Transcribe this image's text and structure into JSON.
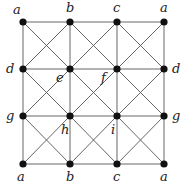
{
  "diagram": {
    "type": "graph",
    "grid_x": [
      23,
      70,
      117,
      164
    ],
    "grid_y": [
      22,
      69,
      116,
      164
    ],
    "colors": {
      "edge": "#555555",
      "node": "#111111",
      "label": "#222222"
    },
    "nodes": [
      {
        "id": "n00",
        "col": 0,
        "row": 0,
        "label": "a",
        "lx": 13,
        "ly": 14
      },
      {
        "id": "n10",
        "col": 1,
        "row": 0,
        "label": "b",
        "lx": 66,
        "ly": 12
      },
      {
        "id": "n20",
        "col": 2,
        "row": 0,
        "label": "c",
        "lx": 113,
        "ly": 12
      },
      {
        "id": "n30",
        "col": 3,
        "row": 0,
        "label": "a",
        "lx": 160,
        "ly": 12
      },
      {
        "id": "n01",
        "col": 0,
        "row": 1,
        "label": "d",
        "lx": 6,
        "ly": 73
      },
      {
        "id": "n11",
        "col": 1,
        "row": 1,
        "label": "e",
        "lx": 56,
        "ly": 82
      },
      {
        "id": "n21",
        "col": 2,
        "row": 1,
        "label": "f",
        "lx": 101,
        "ly": 82
      },
      {
        "id": "n31",
        "col": 3,
        "row": 1,
        "label": "d",
        "lx": 172,
        "ly": 73
      },
      {
        "id": "n02",
        "col": 0,
        "row": 2,
        "label": "g",
        "lx": 6,
        "ly": 120
      },
      {
        "id": "n12",
        "col": 1,
        "row": 2,
        "label": "h",
        "lx": 61,
        "ly": 134
      },
      {
        "id": "n22",
        "col": 2,
        "row": 2,
        "label": "i",
        "lx": 111,
        "ly": 134
      },
      {
        "id": "n32",
        "col": 3,
        "row": 2,
        "label": "g",
        "lx": 172,
        "ly": 120
      },
      {
        "id": "n03",
        "col": 0,
        "row": 3,
        "label": "a",
        "lx": 17,
        "ly": 181
      },
      {
        "id": "n13",
        "col": 1,
        "row": 3,
        "label": "b",
        "lx": 66,
        "ly": 181
      },
      {
        "id": "n23",
        "col": 2,
        "row": 3,
        "label": "c",
        "lx": 113,
        "ly": 181
      },
      {
        "id": "n33",
        "col": 3,
        "row": 3,
        "label": "a",
        "lx": 160,
        "ly": 181
      }
    ]
  }
}
